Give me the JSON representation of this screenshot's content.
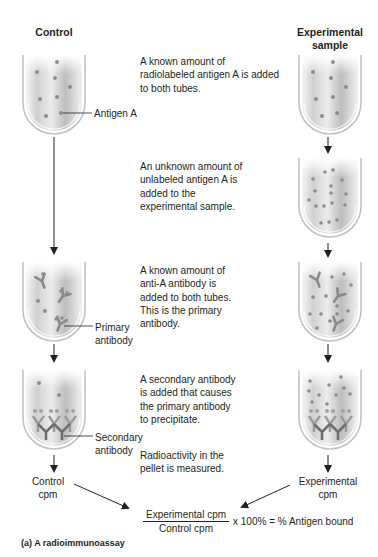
{
  "columns": {
    "control_title": "Control",
    "experimental_title": "Experimental\nsample"
  },
  "steps": [
    {
      "text": "A known amount of radiolabeled antigen A is added to both tubes."
    },
    {
      "text": "An unknown amount of unlabeled antigen A is added to the experimental sample."
    },
    {
      "text": "A known amount of anti-A antibody is added to both tubes. This is the primary antibody."
    },
    {
      "text": "A secondary antibody is added that causes the primary antibody to precipitate."
    },
    {
      "text": "Radioactivity in the pellet is measured."
    }
  ],
  "callouts": {
    "antigen": "Antigen A",
    "primary_antibody": "Primary\nantibody",
    "secondary_antibody": "Secondary\nantibody"
  },
  "results": {
    "control_cpm": "Control\ncpm",
    "experimental_cpm": "Experimental\ncpm"
  },
  "formula": {
    "numerator": "Experimental cpm",
    "denominator": "Control cpm",
    "suffix": "x 100% = % Antigen bound"
  },
  "caption": "(a) A radioimmunoassay",
  "colors": {
    "tube_edge": "#b9b9b9",
    "liquid": "#d9d9d9",
    "dot": "#8c8c8c",
    "arrow": "#231f20",
    "antibody": "#8a8a8a"
  }
}
